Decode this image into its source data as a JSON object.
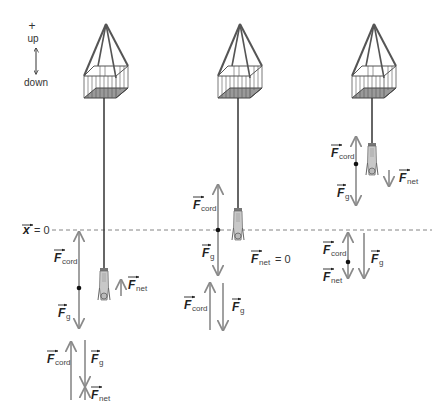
{
  "legend": {
    "plus": "+",
    "up": "up",
    "down": "down"
  },
  "axis": {
    "x_var": "x",
    "x_eq": "= 0"
  },
  "force_symbol": "F",
  "subscripts": {
    "cord": "cord",
    "g": "g",
    "net": "net"
  },
  "panels": [
    {
      "id": "left",
      "description": "jumper below x=0, cord stretched, net force upward",
      "labels": {
        "cord": "cord",
        "g": "g",
        "net": "net"
      },
      "net_suffix": ""
    },
    {
      "id": "middle",
      "description": "jumper at x=0 equilibrium",
      "labels": {
        "cord": "cord",
        "g": "g",
        "net": "net"
      },
      "net_suffix": "= 0"
    },
    {
      "id": "right",
      "description": "jumper above x=0, net force downward",
      "labels": {
        "cord": "cord",
        "g": "g",
        "net": "net"
      },
      "net_suffix": ""
    }
  ],
  "colors": {
    "arrow": "#8a8a8a",
    "line": "#444444",
    "dashed": "#777777",
    "basket_fill": "#9a9a9a"
  }
}
